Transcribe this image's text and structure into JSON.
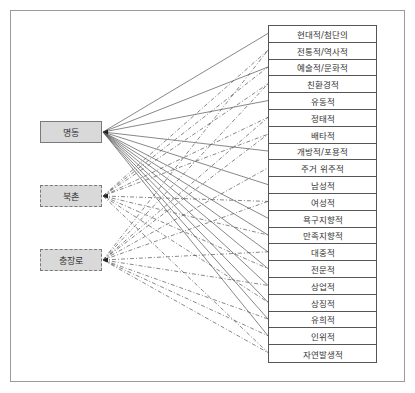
{
  "sources": [
    {
      "label": "명동",
      "style": "solid",
      "y": 132
    },
    {
      "label": "북촌",
      "style": "dashed",
      "y": 196
    },
    {
      "label": "충장로",
      "style": "dashed",
      "y": 260
    }
  ],
  "attributes": [
    {
      "label": "현대적/첨단의"
    },
    {
      "label": "전통적/역사적"
    },
    {
      "label": "예술적/문화적"
    },
    {
      "label": "친환경적"
    },
    {
      "label": "유동적"
    },
    {
      "label": "정태적"
    },
    {
      "label": "배타적"
    },
    {
      "label": "개방적/포용적"
    },
    {
      "label": "주거 위주적"
    },
    {
      "label": "남성적"
    },
    {
      "label": "여성적"
    },
    {
      "label": "욕구지향적"
    },
    {
      "label": "만족지향적"
    },
    {
      "label": "대중적"
    },
    {
      "label": "전문적"
    },
    {
      "label": "상업적"
    },
    {
      "label": "상징적"
    },
    {
      "label": "유희적"
    },
    {
      "label": "인위적"
    },
    {
      "label": "자연발생적"
    }
  ],
  "connections": {
    "명동": [
      0,
      2,
      4,
      7,
      9,
      11,
      12,
      13,
      14,
      15,
      16,
      17,
      18
    ],
    "북촌": [
      1,
      2,
      3,
      5,
      6,
      10,
      12,
      14,
      16,
      19
    ],
    "충장로": [
      1,
      3,
      5,
      6,
      8,
      10,
      13,
      15,
      17,
      18,
      19
    ]
  },
  "colors": {
    "box_fill": "#d9d9d9",
    "line": "#555555",
    "frame": "#9a9a9a"
  }
}
